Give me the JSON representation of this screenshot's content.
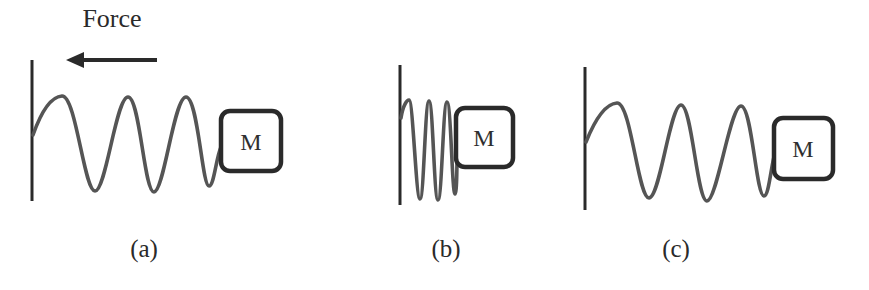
{
  "figure": {
    "force_label": "Force",
    "force_direction": "left",
    "colors": {
      "spring": "#555555",
      "wall": "#2a2a2a",
      "mass_border": "#2a2a2a",
      "arrow": "#2a2a2a",
      "background": "#ffffff"
    },
    "panels": [
      {
        "id": "a",
        "label": "(a)",
        "mass_label": "M",
        "spring_state": "stretched",
        "coils": 3
      },
      {
        "id": "b",
        "label": "(b)",
        "mass_label": "M",
        "spring_state": "compressed",
        "coils": 3
      },
      {
        "id": "c",
        "label": "(c)",
        "mass_label": "M",
        "spring_state": "natural",
        "coils": 3
      }
    ]
  }
}
